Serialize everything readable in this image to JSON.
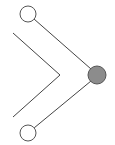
{
  "diagram": {
    "type": "node-link",
    "nodes": [
      {
        "id": "top",
        "cx": 28,
        "cy": 14,
        "r": 8,
        "fill": "#ffffff",
        "stroke": "#555555"
      },
      {
        "id": "bottom",
        "cx": 28,
        "cy": 133,
        "r": 8,
        "fill": "#ffffff",
        "stroke": "#555555"
      },
      {
        "id": "merge",
        "cx": 97,
        "cy": 75,
        "r": 9,
        "fill": "#8c8c8c",
        "stroke": "#555555"
      }
    ],
    "edges": [
      {
        "from": "top",
        "to": "merge"
      },
      {
        "from": "bottom",
        "to": "merge"
      }
    ],
    "chevron": {
      "points": "13,33 60,75 13,117",
      "stroke": "#444444"
    }
  }
}
